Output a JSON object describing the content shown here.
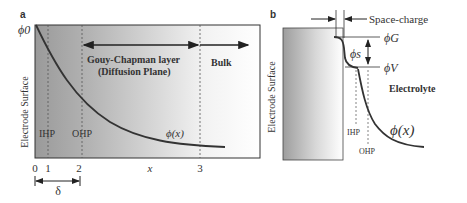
{
  "panel_a": {
    "label": "a",
    "y_axis_label": "Electrode Surface",
    "potential_label": "ϕ0",
    "region_gc_line1": "Gouy-Chapman layer",
    "region_gc_line2": "(Diffusion Plane)",
    "region_bulk": "Bulk",
    "ihp_label": "IHP",
    "ohp_label": "OHP",
    "curve_label": "ϕ(x)",
    "x_ticks": [
      "0",
      "1",
      "2",
      "3"
    ],
    "x_axis_label": "x",
    "delta_label": "δ"
  },
  "panel_b": {
    "label": "b",
    "electrode_label": "Electrode Surface",
    "space_charge_label": "Space-charge",
    "phi_g_label": "ϕG",
    "phi_s_label": "ϕs",
    "phi_v_label": "ϕV",
    "electrolyte_label": "Electrolyte",
    "ihp_label": "IHP",
    "ohp_label": "OHP",
    "curve_label": "ϕ(x)"
  }
}
